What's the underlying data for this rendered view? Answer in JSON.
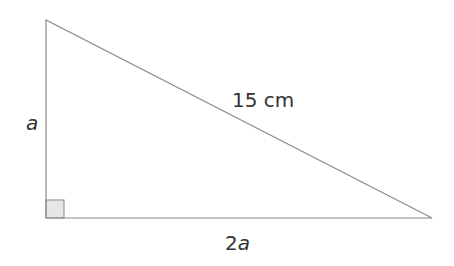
{
  "diagram": {
    "type": "right-triangle",
    "labels": {
      "vertical_side": "a",
      "hypotenuse": "15 cm",
      "horizontal_side_num": "2",
      "horizontal_side_var": "a"
    },
    "colors": {
      "stroke": "#8a8a8a",
      "right_angle_fill": "#e6e6e6",
      "text": "#333333"
    }
  }
}
